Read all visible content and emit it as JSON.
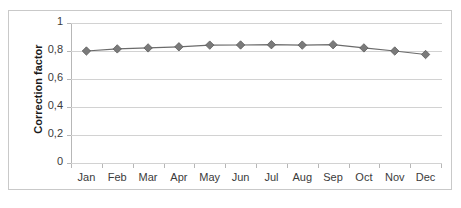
{
  "chart_data": {
    "type": "line",
    "title": "",
    "subtitle": "",
    "xlabel": "",
    "ylabel": "Correction factor",
    "categories": [
      "Jan",
      "Feb",
      "Mar",
      "Apr",
      "May",
      "Jun",
      "Jul",
      "Aug",
      "Sep",
      "Oct",
      "Nov",
      "Dec"
    ],
    "series": [
      {
        "name": "Correction factor",
        "values": [
          0.8,
          0.815,
          0.822,
          0.83,
          0.842,
          0.843,
          0.845,
          0.842,
          0.845,
          0.822,
          0.8,
          0.775
        ],
        "color": "#6b6b6b",
        "marker": "diamond",
        "marker_color": "#7a7a7a"
      }
    ],
    "ylim": [
      0,
      1
    ],
    "y_ticks": [
      0,
      0.2,
      0.4,
      0.6,
      0.8,
      1
    ],
    "y_tick_labels": [
      "0",
      "0,2",
      "0,4",
      "0,6",
      "0,8",
      "1"
    ],
    "grid": true,
    "grid_axis": "y",
    "legend": false,
    "legend_position": "none",
    "plot_background": "#ffffff",
    "grid_color": "#d2d2d2",
    "axis_color": "#b7b7b7",
    "border_color": "#c9c9c9"
  },
  "chart": {
    "y_axis_title": "Correction factor"
  }
}
